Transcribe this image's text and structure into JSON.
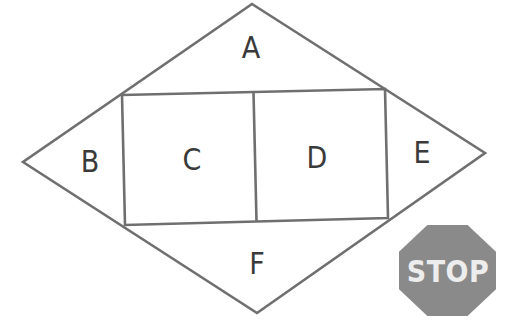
{
  "figure": {
    "region_labels": {
      "a": "A",
      "b": "B",
      "c": "C",
      "d": "D",
      "e": "E",
      "f": "F"
    },
    "stop_sign": {
      "text": "STOP"
    },
    "colors": {
      "outline": "#6f6f6f",
      "label_text": "#3a3a3a",
      "stop_fill": "#8a8a8a",
      "stop_text": "#ededed",
      "background": "#ffffff"
    }
  }
}
